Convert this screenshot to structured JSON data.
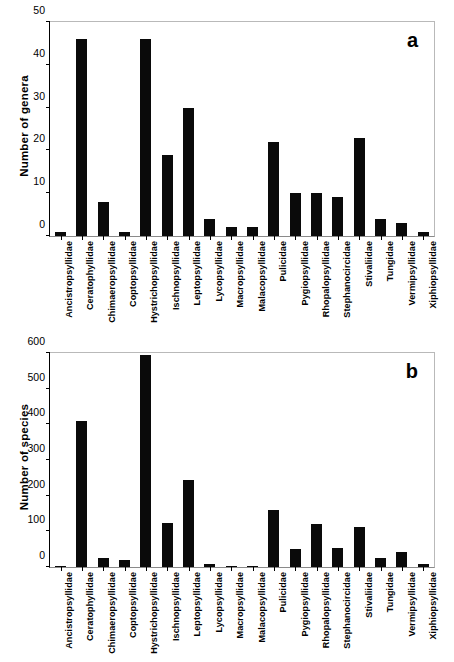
{
  "figure": {
    "background": "#ffffff",
    "bar_color": "#0a0a0a",
    "frame_color": "#b9b9b9"
  },
  "categories": [
    "Ancistropsyllidae",
    "Ceratophyllidae",
    "Chimaeropsyllidae",
    "Coptopsyllidae",
    "Hystrichopsyllidae",
    "Ischnopsyllidae",
    "Leptopsyllidae",
    "Lycopsyllidae",
    "Macropsyllidae",
    "Malacopsyllidae",
    "Pulicidae",
    "Pygiopsyllidae",
    "Rhopalopsyllidae",
    "Stephanocircidae",
    "Stivaliidae",
    "Tungidae",
    "Vermipsyllidae",
    "Xiphiopsyllidae"
  ],
  "panel_a": {
    "letter": "a",
    "ylabel": "Number of genera",
    "yticks": [
      "0",
      "10",
      "20",
      "30",
      "40",
      "50"
    ]
  },
  "panel_b": {
    "letter": "b",
    "ylabel": "Number of species",
    "yticks": [
      "0",
      "100",
      "200",
      "300",
      "400",
      "500",
      "600"
    ]
  },
  "chart_data": [
    {
      "type": "bar",
      "title": "a",
      "xlabel": "",
      "ylabel": "Number of genera",
      "ylim": [
        0,
        50
      ],
      "yticks": [
        0,
        10,
        20,
        30,
        40,
        50
      ],
      "grid": false,
      "legend": false,
      "categories": [
        "Ancistropsyllidae",
        "Ceratophyllidae",
        "Chimaeropsyllidae",
        "Coptopsyllidae",
        "Hystrichopsyllidae",
        "Ischnopsyllidae",
        "Leptopsyllidae",
        "Lycopsyllidae",
        "Macropsyllidae",
        "Malacopsyllidae",
        "Pulicidae",
        "Pygiopsyllidae",
        "Rhopalopsyllidae",
        "Stephanocircidae",
        "Stivaliidae",
        "Tungidae",
        "Vermipsyllidae",
        "Xiphiopsyllidae"
      ],
      "values": [
        1,
        46,
        8,
        1,
        46,
        19,
        30,
        4,
        2,
        2,
        22,
        10,
        10,
        9,
        23,
        4,
        3,
        1
      ]
    },
    {
      "type": "bar",
      "title": "b",
      "xlabel": "",
      "ylabel": "Number of species",
      "ylim": [
        0,
        600
      ],
      "yticks": [
        0,
        100,
        200,
        300,
        400,
        500,
        600
      ],
      "grid": false,
      "legend": false,
      "categories": [
        "Ancistropsyllidae",
        "Ceratophyllidae",
        "Chimaeropsyllidae",
        "Coptopsyllidae",
        "Hystrichopsyllidae",
        "Ischnopsyllidae",
        "Leptopsyllidae",
        "Lycopsyllidae",
        "Macropsyllidae",
        "Malacopsyllidae",
        "Pulicidae",
        "Pygiopsyllidae",
        "Rhopalopsyllidae",
        "Stephanocircidae",
        "Stivaliidae",
        "Tungidae",
        "Vermipsyllidae",
        "Xiphiopsyllidae"
      ],
      "values": [
        3,
        408,
        26,
        19,
        594,
        124,
        243,
        8,
        2,
        4,
        161,
        50,
        122,
        52,
        112,
        25,
        41,
        9
      ]
    }
  ]
}
